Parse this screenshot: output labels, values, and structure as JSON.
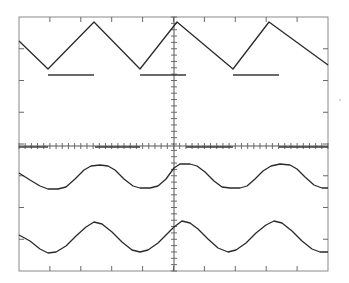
{
  "display": {
    "type": "oscilloscope-graticule",
    "frame": {
      "left": 19,
      "top": 17,
      "right": 328,
      "bottom": 271
    },
    "center": {
      "x": 174,
      "y": 146
    },
    "divisions": {
      "horizontal": 10,
      "vertical": 8
    },
    "colors": {
      "background": "#ffffff",
      "trace": "#2a2a2a",
      "graticule": "#8a8a8a"
    }
  },
  "traces": [
    {
      "name": "triangle-wave",
      "points": [
        [
          19,
          41
        ],
        [
          48,
          69
        ],
        [
          94,
          22
        ],
        [
          140,
          69
        ],
        [
          177,
          22
        ],
        [
          233,
          69
        ],
        [
          269,
          22
        ],
        [
          328,
          65
        ]
      ]
    },
    {
      "name": "square-level-bars",
      "segments": [
        [
          48,
          75,
          94,
          75
        ],
        [
          140,
          75,
          186,
          75
        ],
        [
          233,
          75,
          279,
          75
        ]
      ]
    },
    {
      "name": "axis-bars",
      "segments": [
        [
          19,
          147,
          48,
          147
        ],
        [
          95,
          147,
          140,
          147
        ],
        [
          186,
          147,
          233,
          147
        ],
        [
          279,
          147,
          328,
          147
        ]
      ]
    },
    {
      "name": "clipped-sine-wave",
      "points": [
        [
          19,
          173
        ],
        [
          30,
          180
        ],
        [
          40,
          186
        ],
        [
          48,
          189
        ],
        [
          58,
          189
        ],
        [
          66,
          187
        ],
        [
          75,
          179
        ],
        [
          84,
          170
        ],
        [
          91,
          166
        ],
        [
          100,
          165
        ],
        [
          108,
          166
        ],
        [
          115,
          170
        ],
        [
          124,
          179
        ],
        [
          133,
          186
        ],
        [
          140,
          188
        ],
        [
          150,
          188
        ],
        [
          158,
          186
        ],
        [
          166,
          179
        ],
        [
          174,
          168
        ],
        [
          180,
          164
        ],
        [
          190,
          164
        ],
        [
          197,
          166
        ],
        [
          205,
          172
        ],
        [
          214,
          181
        ],
        [
          222,
          187
        ],
        [
          230,
          188
        ],
        [
          240,
          188
        ],
        [
          247,
          186
        ],
        [
          255,
          179
        ],
        [
          263,
          171
        ],
        [
          271,
          166
        ],
        [
          280,
          164
        ],
        [
          290,
          165
        ],
        [
          297,
          169
        ],
        [
          305,
          177
        ],
        [
          314,
          185
        ],
        [
          322,
          188
        ],
        [
          328,
          188
        ]
      ]
    },
    {
      "name": "sine-wave",
      "points": [
        [
          19,
          235
        ],
        [
          30,
          241
        ],
        [
          40,
          249
        ],
        [
          48,
          253
        ],
        [
          56,
          252
        ],
        [
          66,
          246
        ],
        [
          76,
          236
        ],
        [
          86,
          227
        ],
        [
          94,
          222
        ],
        [
          102,
          224
        ],
        [
          112,
          232
        ],
        [
          122,
          242
        ],
        [
          132,
          250
        ],
        [
          140,
          252
        ],
        [
          148,
          250
        ],
        [
          158,
          243
        ],
        [
          168,
          233
        ],
        [
          174,
          227
        ],
        [
          182,
          221
        ],
        [
          190,
          223
        ],
        [
          198,
          229
        ],
        [
          208,
          239
        ],
        [
          218,
          248
        ],
        [
          228,
          252
        ],
        [
          236,
          250
        ],
        [
          246,
          243
        ],
        [
          256,
          233
        ],
        [
          266,
          225
        ],
        [
          274,
          221
        ],
        [
          282,
          223
        ],
        [
          292,
          231
        ],
        [
          302,
          241
        ],
        [
          312,
          249
        ],
        [
          320,
          252
        ],
        [
          328,
          252
        ]
      ]
    }
  ]
}
